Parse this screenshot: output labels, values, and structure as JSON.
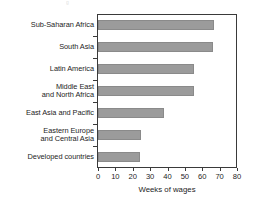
{
  "chart_data": {
    "type": "bar",
    "orientation": "horizontal",
    "title": "",
    "subtitle": "",
    "xlabel": "Weeks of wages",
    "ylabel": "",
    "xlim": [
      0,
      80
    ],
    "xticks": [
      0,
      10,
      20,
      30,
      40,
      50,
      60,
      70,
      80
    ],
    "xtick_labels": [
      "0",
      "10",
      "20",
      "30",
      "40",
      "50",
      "60",
      "70",
      "80"
    ],
    "grid": false,
    "legend": false,
    "legend_position": "none",
    "bar_color": "#9b9b9b",
    "frame_color": "#3a3a3a",
    "categories": [
      "Sub-Saharan Africa",
      "South Asia",
      "Latin America",
      "Middle East and North Africa",
      "East Asia and Pacific",
      "Eastern Europe and Central Asia",
      "Developed countries"
    ],
    "category_labels": [
      [
        "Sub-Saharan Africa"
      ],
      [
        "South Asia"
      ],
      [
        "Latin America"
      ],
      [
        "Middle East",
        "and North Africa"
      ],
      [
        "East Asia and Pacific"
      ],
      [
        "Eastern Europe",
        "and Central Asia"
      ],
      [
        "Developed countries"
      ]
    ],
    "values": [
      67,
      66,
      55,
      55,
      38,
      25,
      24
    ]
  },
  "top_sliver": {
    "text": "g"
  }
}
